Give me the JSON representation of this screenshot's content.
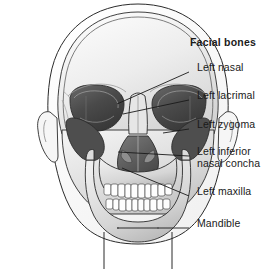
{
  "figure": {
    "title": "Facial bones",
    "colors": {
      "ink": "#1a1a1a",
      "outline": "#2b2b2b",
      "bone_light": "#efefef",
      "bone_mid": "#cfcfcf",
      "bone_shadow": "#a8a8a8",
      "orbit_dark": "#4a4a4a",
      "orbit_darkest": "#3a3a3a",
      "tooth": "#fdfdfd",
      "background": "#ffffff"
    }
  },
  "labels": [
    {
      "id": "title",
      "text": "Facial bones",
      "bold": true,
      "x": 190,
      "y": 44,
      "leader": false
    },
    {
      "id": "left-nasal",
      "text": "Left nasal",
      "bold": false,
      "x": 197,
      "y": 68,
      "leader": true,
      "line": {
        "x1": 189,
        "y1": 72,
        "x2": 117,
        "y2": 104
      }
    },
    {
      "id": "left-lacrimal",
      "text": "Left lacrimal",
      "bold": false,
      "x": 197,
      "y": 96,
      "leader": true,
      "line": {
        "x1": 189,
        "y1": 100,
        "x2": 123,
        "y2": 114
      }
    },
    {
      "id": "left-zygoma",
      "text": "Left zygoma",
      "bold": false,
      "x": 197,
      "y": 125,
      "leader": true,
      "line": {
        "x1": 189,
        "y1": 129,
        "x2": 163,
        "y2": 133
      }
    },
    {
      "id": "left-inferior-nasal-concha",
      "text": "Left inferior\nnasal concha",
      "bold": false,
      "x": 197,
      "y": 152,
      "leader": true,
      "line": {
        "x1": 189,
        "y1": 156,
        "x2": 118,
        "y2": 152
      }
    },
    {
      "id": "left-maxilla",
      "text": "Left maxilla",
      "bold": false,
      "x": 197,
      "y": 192,
      "leader": true,
      "line": {
        "x1": 189,
        "y1": 196,
        "x2": 122,
        "y2": 168
      }
    },
    {
      "id": "mandible",
      "text": "Mandible",
      "bold": false,
      "x": 197,
      "y": 225,
      "leader": true,
      "line": {
        "x1": 189,
        "y1": 228,
        "x2": 117,
        "y2": 228
      }
    }
  ]
}
